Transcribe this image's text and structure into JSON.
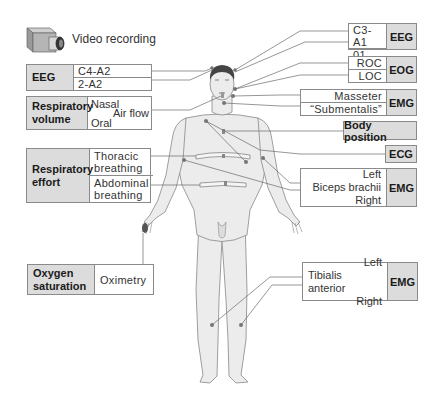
{
  "video": {
    "icon": "video-camera-icon",
    "label": "Video recording"
  },
  "left": {
    "eeg": {
      "header": "EEG",
      "channels": [
        "C4-A2",
        "2-A2"
      ]
    },
    "respiratory_volume": {
      "header": "Respiratory volume",
      "header_lines": [
        "Respiratory",
        "volume"
      ],
      "nasal": "Nasal",
      "oral": "Oral",
      "airflow": "Air flow"
    },
    "respiratory_effort": {
      "header_lines": [
        "Respiratory",
        "effort"
      ],
      "thoracic_lines": [
        "Thoracic",
        "breathing"
      ],
      "abdominal_lines": [
        "Abdominal",
        "breathing"
      ]
    },
    "oxygen": {
      "header_lines": [
        "Oxygen",
        "saturation"
      ],
      "method": "Oximetry"
    }
  },
  "right": {
    "eeg": {
      "header": "EEG",
      "channels": [
        "C3-A1",
        "01-A1"
      ]
    },
    "eog": {
      "header": "EOG",
      "channels": [
        "ROC",
        "LOC"
      ]
    },
    "emg_face": {
      "header": "EMG",
      "channels": [
        "Masseter",
        "“Submentalis”"
      ]
    },
    "body_position": {
      "label": "Body position"
    },
    "ecg": {
      "label": "ECG"
    },
    "emg_arm": {
      "header": "EMG",
      "lines": [
        "Left",
        "Biceps brachii",
        "Right"
      ]
    },
    "emg_leg": {
      "header": "EMG",
      "lines": [
        "Left",
        "Tibialis anterior",
        "Right"
      ]
    }
  },
  "colors": {
    "header_bg": "#dcdcdc",
    "border": "#8a8a8a",
    "body_fill": "#ececec",
    "electrode": "#777777"
  }
}
